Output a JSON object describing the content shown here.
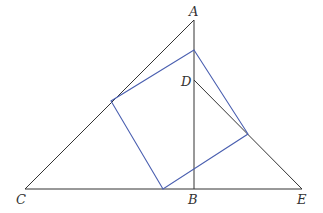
{
  "diagram": {
    "title": "",
    "colors": {
      "triangle_stroke": "#333333",
      "square_stroke": "#4a5fb0",
      "label": "#333333"
    },
    "points": {
      "A": {
        "label": "A",
        "x": 194,
        "y": 20
      },
      "B": {
        "label": "B",
        "x": 194,
        "y": 189
      },
      "C": {
        "label": "C",
        "x": 25,
        "y": 189
      },
      "D": {
        "label": "D",
        "x": 194,
        "y": 80
      },
      "E": {
        "label": "E",
        "x": 302,
        "y": 189
      }
    },
    "labels": [
      {
        "id": "A",
        "text": "A"
      },
      {
        "id": "B",
        "text": "B"
      },
      {
        "id": "C",
        "text": "C"
      },
      {
        "id": "D",
        "text": "D"
      },
      {
        "id": "E",
        "text": "E"
      }
    ],
    "square_vertices": [
      {
        "x": 194,
        "y": 50
      },
      {
        "x": 248,
        "y": 134
      },
      {
        "x": 163,
        "y": 189
      },
      {
        "x": 111,
        "y": 101
      }
    ],
    "segments": [
      "AC",
      "CE",
      "AB",
      "DE"
    ]
  }
}
